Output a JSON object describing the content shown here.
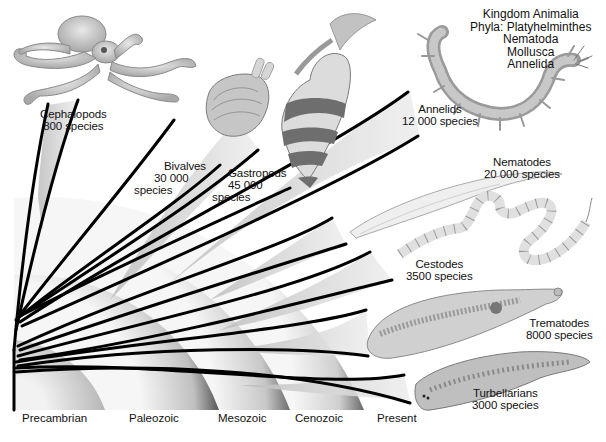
{
  "title": {
    "kingdom": "Kingdom Animalia",
    "phyla_line": "Phyla: Platyhelminthes",
    "phyla": [
      "Nematoda",
      "Mollusca",
      "Annelida"
    ]
  },
  "eras": {
    "precambrian": "Precambrian",
    "paleozoic": "Paleozoic",
    "mesozoic": "Mesozoic",
    "cenozoic": "Cenozoic",
    "present": "Present"
  },
  "groups": {
    "cephalopods": {
      "name": "Cephalopods",
      "count": "800 species"
    },
    "bivalves": {
      "name": "Bivalves",
      "count1": "30 000",
      "count2": "species"
    },
    "gastropods": {
      "name": "Gastropods",
      "count1": "45 000",
      "count2": "species"
    },
    "annelids": {
      "name": "Annelids",
      "count": "12 000 species"
    },
    "nematodes": {
      "name": "Nematodes",
      "count": "20 000 species"
    },
    "cestodes": {
      "name": "Cestodes",
      "count": "3500 species"
    },
    "trematodes": {
      "name": "Trematodes",
      "count": "8000 species"
    },
    "turbellarians": {
      "name": "Turbellarians",
      "count": "3000 species"
    }
  },
  "colors": {
    "branch": "#000000",
    "arc_dark": "#5a5a5a",
    "arc_light": "#f4f4f4",
    "wedge": "#cfcfcf"
  }
}
